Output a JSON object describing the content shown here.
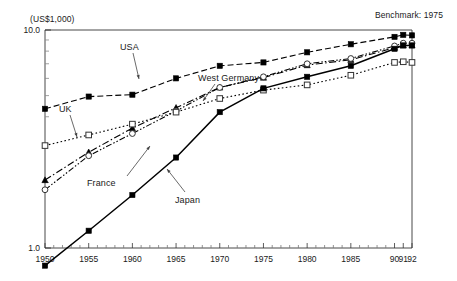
{
  "figure": {
    "unit_label": "(US$1,000)",
    "benchmark_label": "Benchmark: 1975"
  },
  "chart_data": {
    "type": "line",
    "title": "",
    "subtitle": "",
    "xlabel": "",
    "ylabel": "(US$1,000)",
    "note": "Benchmark: 1975",
    "yscale": "log",
    "ylim": [
      1.0,
      10.0
    ],
    "xlim": [
      1950,
      1992
    ],
    "grid": false,
    "legend": "annotations-with-arrows",
    "y_tick_labels": [
      "1.0",
      "10.0"
    ],
    "y_tick_values": [
      1.0,
      10.0
    ],
    "y_minor_ticks": [
      2,
      3,
      4,
      5,
      6,
      7,
      8,
      9
    ],
    "x_tick_labels": [
      "1950",
      "1955",
      "1960",
      "1965",
      "1970",
      "1975",
      "1980",
      "1985",
      "90",
      "91",
      "92"
    ],
    "x_tick_values": [
      1950,
      1955,
      1960,
      1965,
      1970,
      1975,
      1980,
      1985,
      1990,
      1991,
      1992
    ],
    "x_minor_tick_step": 1,
    "x": [
      1950,
      1955,
      1960,
      1965,
      1970,
      1975,
      1980,
      1985,
      1990,
      1991,
      1992
    ],
    "series": [
      {
        "name": "USA",
        "marker": "filled-square",
        "line": "dashed",
        "color": "#000000",
        "values": [
          4.35,
          4.95,
          5.05,
          6.0,
          6.85,
          7.1,
          7.9,
          8.6,
          9.3,
          9.5,
          9.45
        ]
      },
      {
        "name": "West Germany",
        "marker": "filled-triangle",
        "line": "dash-dot",
        "color": "#000000",
        "values": [
          2.05,
          2.75,
          3.55,
          4.4,
          5.45,
          6.05,
          6.9,
          7.3,
          8.3,
          8.5,
          8.5
        ]
      },
      {
        "name": "France",
        "marker": "open-circle",
        "line": "dash-dot-dot",
        "color": "#000000",
        "values": [
          1.85,
          2.65,
          3.35,
          4.25,
          5.45,
          6.1,
          7.0,
          7.4,
          8.45,
          8.7,
          8.7
        ]
      },
      {
        "name": "UK",
        "marker": "open-square",
        "line": "dotted",
        "color": "#000000",
        "values": [
          2.95,
          3.3,
          3.7,
          4.2,
          4.85,
          5.3,
          5.6,
          6.2,
          7.1,
          7.15,
          7.1
        ]
      },
      {
        "name": "Japan",
        "marker": "filled-square",
        "line": "solid",
        "color": "#000000",
        "values": [
          0.83,
          1.2,
          1.75,
          2.6,
          4.2,
          5.4,
          6.1,
          6.85,
          8.2,
          8.5,
          8.5
        ]
      }
    ],
    "annotations": [
      {
        "label": "USA",
        "points_to": "USA series near 1965"
      },
      {
        "label": "West Germany",
        "points_to": "West Germany series near 1972"
      },
      {
        "label": "UK",
        "points_to": "UK series near 1955"
      },
      {
        "label": "France",
        "points_to": "France series near 1962"
      },
      {
        "label": "Japan",
        "points_to": "Japan series near 1964"
      }
    ]
  },
  "annotations": {
    "usa": "USA",
    "west_germany": "West Germany",
    "uk": "UK",
    "france": "France",
    "japan": "Japan"
  }
}
